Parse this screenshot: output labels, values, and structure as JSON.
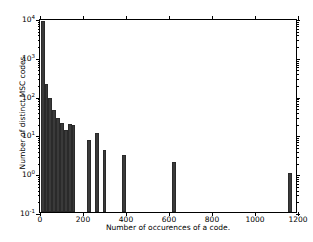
{
  "chart_data": {
    "type": "bar",
    "title": "",
    "xlabel": "Number of occurences of a code.",
    "ylabel": "Number of distinct MSC codes.",
    "xlim": [
      0,
      1200
    ],
    "ylim": [
      0.1,
      10000
    ],
    "yscale": "log",
    "grid": false,
    "legend": null,
    "xticks": [
      0,
      200,
      400,
      600,
      800,
      1000,
      1200
    ],
    "xticklabels": [
      "0",
      "200",
      "400",
      "600",
      "800",
      "1000",
      "1200"
    ],
    "yticks": [
      0.1,
      1,
      10,
      100,
      1000,
      10000
    ],
    "yticklabels": [
      "10-1",
      "100",
      "101",
      "102",
      "103",
      "104"
    ],
    "ytick_exponents": [
      "-1",
      "0",
      "1",
      "2",
      "3",
      "4"
    ],
    "ytick_mantissa": "10",
    "bin_width": 18,
    "bars": [
      {
        "x": 3,
        "value": 8300
      },
      {
        "x": 21,
        "value": 200
      },
      {
        "x": 39,
        "value": 85
      },
      {
        "x": 57,
        "value": 42
      },
      {
        "x": 75,
        "value": 27
      },
      {
        "x": 93,
        "value": 20
      },
      {
        "x": 111,
        "value": 13
      },
      {
        "x": 129,
        "value": 19
      },
      {
        "x": 147,
        "value": 17
      },
      {
        "x": 219,
        "value": 7
      },
      {
        "x": 255,
        "value": 11
      },
      {
        "x": 291,
        "value": 4
      },
      {
        "x": 381,
        "value": 3
      },
      {
        "x": 615,
        "value": 2
      },
      {
        "x": 1155,
        "value": 1
      }
    ],
    "bar_color": "#3a3a3a"
  }
}
